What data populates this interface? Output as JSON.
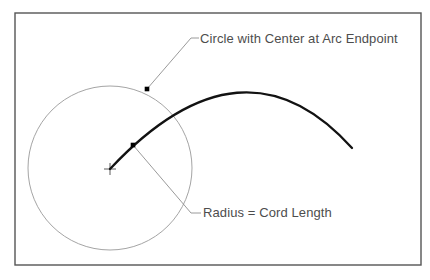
{
  "figure": {
    "kind": "technical-line-drawing",
    "background_color": "#ffffff",
    "frame": {
      "name": "diagram-frame",
      "x": 15,
      "y": 13,
      "width": 406,
      "height": 252,
      "stroke_color": "#555555",
      "stroke_width": 1.4,
      "fill": "none"
    }
  },
  "labels": {
    "circle_center": "Circle with Center at Arc Endpoint",
    "radius_cord": "Radius = Cord Length"
  },
  "geometry": {
    "circle": {
      "name": "construction-circle",
      "center_x": 110,
      "center_y": 168,
      "radius": 82,
      "stroke_color": "#9a9a9a",
      "stroke_width": 0.9,
      "fill": "none"
    },
    "center_mark": {
      "name": "circle-center-cross",
      "x": 110,
      "y": 169,
      "arm": 6,
      "stroke_color": "#4a4a4a",
      "stroke_width": 0.9
    },
    "arc": {
      "name": "main-arc",
      "start_x": 110,
      "start_y": 169,
      "control_x": 243,
      "control_y": 27,
      "end_x": 352,
      "end_y": 148,
      "apex_x": 240,
      "apex_y": 88,
      "stroke_color": "#121212",
      "stroke_width": 2.3,
      "fill": "none"
    },
    "points": [
      {
        "name": "arc-circle-intersection-point",
        "x": 147,
        "y": 89,
        "size": 4.6,
        "color": "#000000"
      },
      {
        "name": "arc-endpoint-marker-point",
        "x": 133,
        "y": 145,
        "size": 4.6,
        "color": "#000000"
      }
    ],
    "leaders": [
      {
        "name": "leader-circle-center",
        "from_x": 147,
        "from_y": 89,
        "bend_x": 191,
        "bend_y": 38,
        "to_x": 199,
        "to_y": 38,
        "stroke_color": "#8f8f8f",
        "stroke_width": 0.9
      },
      {
        "name": "leader-radius-cord",
        "from_x": 133,
        "from_y": 145,
        "bend_x": 191,
        "bend_y": 213,
        "to_x": 201,
        "to_y": 213,
        "stroke_color": "#8f8f8f",
        "stroke_width": 0.9
      }
    ]
  },
  "colors": {
    "page_background": "#ffffff",
    "frame_stroke": "#555555",
    "circle_stroke": "#9a9a9a",
    "arc_stroke": "#121212",
    "leader_stroke": "#8f8f8f",
    "text": "#4d4d4d",
    "point_fill": "#000000"
  }
}
